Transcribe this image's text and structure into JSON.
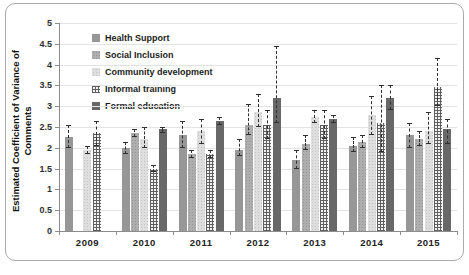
{
  "chart_data": {
    "type": "bar",
    "title": "",
    "ylabel": "Estimated Coefficient of Variance of Comments",
    "xlabel": "",
    "ylim": [
      0,
      5
    ],
    "ytick_step": 0.5,
    "yticks": [
      "0",
      "0.5",
      "1",
      "1.5",
      "2",
      "2.5",
      "3",
      "3.5",
      "4",
      "4.5",
      "5"
    ],
    "grid": "horizontal",
    "legend_position": "top-left-inside",
    "error_bar_style": "dashed-with-caps",
    "categories": [
      "2009",
      "2010",
      "2011",
      "2012",
      "2013",
      "2014",
      "2015"
    ],
    "series": [
      {
        "name": "Health Support",
        "pattern": "solid-medium-gray",
        "color": "#979797",
        "values": [
          2.25,
          2.0,
          2.3,
          1.95,
          1.7,
          2.05,
          2.3
        ],
        "errors": [
          [
            2.0,
            2.55
          ],
          [
            1.85,
            2.15
          ],
          [
            2.0,
            2.65
          ],
          [
            1.8,
            2.2
          ],
          [
            1.5,
            1.95
          ],
          [
            1.9,
            2.25
          ],
          [
            2.0,
            2.6
          ]
        ]
      },
      {
        "name": "Social Inclusion",
        "pattern": "dotted-medium-gray",
        "color": "#aeaeae",
        "values": [
          null,
          2.35,
          1.85,
          2.55,
          2.1,
          2.15,
          2.2
        ],
        "errors": [
          null,
          [
            2.25,
            2.45
          ],
          [
            1.75,
            1.95
          ],
          [
            2.3,
            3.05
          ],
          [
            1.95,
            2.3
          ],
          [
            2.0,
            2.3
          ],
          [
            2.05,
            2.4
          ]
        ]
      },
      {
        "name": "Community development",
        "pattern": "dotted-light-gray",
        "color": "#dedede",
        "values": [
          1.95,
          2.2,
          2.4,
          2.85,
          2.75,
          2.8,
          2.4
        ],
        "errors": [
          [
            1.85,
            2.05
          ],
          [
            2.0,
            2.5
          ],
          [
            2.1,
            2.7
          ],
          [
            2.5,
            3.3
          ],
          [
            2.6,
            2.9
          ],
          [
            2.3,
            3.25
          ],
          [
            2.1,
            2.85
          ]
        ]
      },
      {
        "name": "Informal training",
        "pattern": "checkered-grid",
        "color": "#5f5f5f",
        "values": [
          2.35,
          1.5,
          1.85,
          2.55,
          2.55,
          2.6,
          3.45
        ],
        "errors": [
          [
            2.05,
            2.65
          ],
          [
            1.42,
            1.58
          ],
          [
            1.75,
            1.95
          ],
          [
            2.2,
            2.9
          ],
          [
            2.2,
            2.9
          ],
          [
            1.9,
            3.5
          ],
          [
            3.0,
            4.15
          ]
        ]
      },
      {
        "name": "Formal education",
        "pattern": "solid-dark-gray",
        "color": "#686868",
        "values": [
          null,
          2.45,
          2.65,
          3.2,
          2.7,
          3.2,
          2.45
        ],
        "errors": [
          null,
          [
            2.35,
            2.5
          ],
          [
            2.55,
            2.75
          ],
          [
            2.6,
            4.45
          ],
          [
            2.6,
            2.8
          ],
          [
            2.9,
            3.5
          ],
          [
            2.1,
            2.7
          ]
        ]
      }
    ]
  },
  "frame": {
    "border_color": "#ababab",
    "background": "#ffffff"
  }
}
